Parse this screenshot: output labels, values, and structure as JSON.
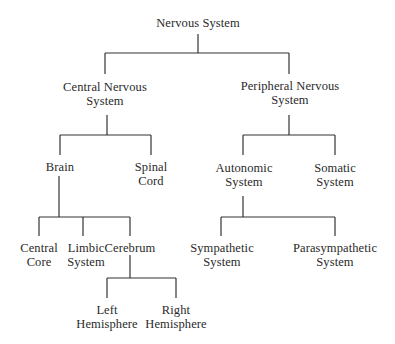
{
  "diagram": {
    "type": "tree",
    "title": "Nervous System",
    "nodes": {
      "root": {
        "line1": "Nervous System",
        "line2": ""
      },
      "cns": {
        "line1": "Central Nervous",
        "line2": "System"
      },
      "pns": {
        "line1": "Peripheral Nervous",
        "line2": "System"
      },
      "brain": {
        "line1": "Brain",
        "line2": ""
      },
      "spinal": {
        "line1": "Spinal",
        "line2": "Cord"
      },
      "autonomic": {
        "line1": "Autonomic",
        "line2": "System"
      },
      "somatic": {
        "line1": "Somatic",
        "line2": "System"
      },
      "central_core": {
        "line1": "Central",
        "line2": "Core"
      },
      "limbic": {
        "line1": "Limbic",
        "line2": "System"
      },
      "cerebrum": {
        "line1": "Cerebrum",
        "line2": ""
      },
      "sympathetic": {
        "line1": "Sympathetic",
        "line2": "System"
      },
      "parasympathetic": {
        "line1": "Parasympathetic",
        "line2": "System"
      },
      "left_hemi": {
        "line1": "Left",
        "line2": "Hemisphere"
      },
      "right_hemi": {
        "line1": "Right",
        "line2": "Hemisphere"
      }
    },
    "edges": [
      [
        "Nervous System",
        "Central Nervous System"
      ],
      [
        "Nervous System",
        "Peripheral Nervous System"
      ],
      [
        "Central Nervous System",
        "Brain"
      ],
      [
        "Central Nervous System",
        "Spinal Cord"
      ],
      [
        "Peripheral Nervous System",
        "Autonomic System"
      ],
      [
        "Peripheral Nervous System",
        "Somatic System"
      ],
      [
        "Brain",
        "Central Core"
      ],
      [
        "Brain",
        "Limbic System"
      ],
      [
        "Brain",
        "Cerebrum"
      ],
      [
        "Autonomic System",
        "Sympathetic System"
      ],
      [
        "Autonomic System",
        "Parasympathetic System"
      ],
      [
        "Cerebrum",
        "Left Hemisphere"
      ],
      [
        "Cerebrum",
        "Right Hemisphere"
      ]
    ]
  }
}
